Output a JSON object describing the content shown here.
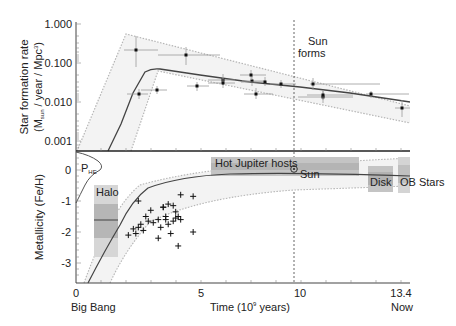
{
  "chart_data": [
    {
      "type": "scatter",
      "title": "",
      "xlabel": "Time (10^9 years)",
      "ylabel": "Star formation rate (M_sun / year / Mpc^3)",
      "yscale": "log",
      "ylim": [
        0.0005,
        1.0
      ],
      "xlim": [
        0,
        13.4
      ],
      "ytick_labels": [
        "1.000",
        "0.100",
        "0.010",
        "0.001"
      ],
      "points": [
        {
          "x": 2.2,
          "y": 0.19,
          "xerr": [
            1.4,
            3.0
          ],
          "yerr": [
            0.065,
            0.45
          ]
        },
        {
          "x": 2.5,
          "y": 0.015,
          "xerr": [
            1.9,
            3.1
          ],
          "yerr": [
            0.012,
            0.019
          ]
        },
        {
          "x": 3.0,
          "y": 0.017,
          "xerr": [
            2.6,
            3.7
          ],
          "yerr": [
            0.014,
            0.021
          ]
        },
        {
          "x": 4.4,
          "y": 0.15,
          "xerr": [
            3.0,
            7.2
          ],
          "yerr": [
            0.09,
            0.25
          ]
        },
        {
          "x": 5.2,
          "y": 0.023,
          "xerr": [
            4.5,
            5.9
          ],
          "yerr": [
            0.018,
            0.03
          ]
        },
        {
          "x": 6.2,
          "y": 0.033,
          "xerr": [
            5.2,
            7.0
          ],
          "yerr": [
            0.026,
            0.042
          ]
        },
        {
          "x": 6.2,
          "y": 0.028,
          "xerr": [
            5.2,
            7.0
          ],
          "yerr": [
            0.022,
            0.035
          ]
        },
        {
          "x": 7.2,
          "y": 0.032,
          "xerr": [
            6.3,
            8.0
          ],
          "yerr": [
            0.026,
            0.04
          ]
        },
        {
          "x": 7.7,
          "y": 0.042,
          "xerr": [
            7.0,
            8.5
          ],
          "yerr": [
            0.035,
            0.05
          ]
        },
        {
          "x": 8.2,
          "y": 0.015,
          "xerr": [
            7.1,
            9.3
          ],
          "yerr": [
            0.012,
            0.019
          ]
        },
        {
          "x": 8.5,
          "y": 0.031,
          "xerr": [
            7.6,
            9.4
          ],
          "yerr": [
            0.026,
            0.037
          ]
        },
        {
          "x": 9.2,
          "y": 0.028,
          "xerr": [
            8.7,
            9.7
          ],
          "yerr": [
            0.024,
            0.033
          ]
        },
        {
          "x": 10.5,
          "y": 0.028,
          "xerr": [
            9.9,
            13.1
          ],
          "yerr": [
            0.02,
            0.036
          ]
        },
        {
          "x": 11.1,
          "y": 0.013,
          "xerr": [
            9.9,
            11.9
          ],
          "yerr": [
            0.011,
            0.016
          ]
        },
        {
          "x": 11.2,
          "y": 0.014,
          "xerr": [
            10.3,
            12.1
          ],
          "yerr": [
            0.012,
            0.017
          ]
        },
        {
          "x": 12.8,
          "y": 0.015,
          "xerr": [
            12.7,
            13.4
          ],
          "yerr": [
            0.013,
            0.017
          ]
        },
        {
          "x": 13.2,
          "y": 0.0065,
          "xerr": [
            12.8,
            13.5
          ],
          "yerr": [
            0.004,
            0.011
          ]
        }
      ],
      "model_curve": {
        "x": [
          1.3,
          1.8,
          2.3,
          2.8,
          3.3,
          5,
          7,
          9,
          11,
          13.4
        ],
        "y": [
          0.0005,
          0.0025,
          0.015,
          0.055,
          0.072,
          0.055,
          0.04,
          0.03,
          0.022,
          0.015
        ]
      },
      "envelope_upper": {
        "x": [
          0.05,
          2.0,
          13.4
        ],
        "y": [
          0.0005,
          0.55,
          0.02
        ]
      },
      "envelope_lower": {
        "x": [
          2.2,
          3.3,
          13.4
        ],
        "y": [
          0.0005,
          0.014,
          0.0055
        ]
      },
      "annotations": [
        {
          "text": "Sun forms",
          "x": 9.6
        }
      ]
    },
    {
      "type": "scatter",
      "xlabel": "Time (10^9 years)",
      "ylabel": "Metallicity (Fe/H)",
      "ylim": [
        -3.6,
        0.6
      ],
      "xlim": [
        0,
        13.4
      ],
      "ytick_labels": [
        "0",
        "-1",
        "-2",
        "-3"
      ],
      "xtick_labels": [
        "0",
        "5",
        "10",
        "13.4"
      ],
      "xtick_sublabels": [
        "Big Bang",
        "",
        "",
        "Now"
      ],
      "halo_stars": [
        {
          "x": 2.5,
          "y": -1.0
        },
        {
          "x": 3.0,
          "y": -1.3
        },
        {
          "x": 3.5,
          "y": -1.2
        },
        {
          "x": 3.7,
          "y": -1.1
        },
        {
          "x": 3.9,
          "y": -1.15
        },
        {
          "x": 4.2,
          "y": -0.8
        },
        {
          "x": 4.7,
          "y": -0.85
        },
        {
          "x": 2.8,
          "y": -1.5
        },
        {
          "x": 2.9,
          "y": -1.65
        },
        {
          "x": 3.1,
          "y": -1.7
        },
        {
          "x": 3.3,
          "y": -1.6
        },
        {
          "x": 3.6,
          "y": -1.5
        },
        {
          "x": 3.6,
          "y": -1.6
        },
        {
          "x": 3.7,
          "y": -1.75
        },
        {
          "x": 3.9,
          "y": -1.65
        },
        {
          "x": 4.0,
          "y": -1.55
        },
        {
          "x": 4.1,
          "y": -1.5
        },
        {
          "x": 4.2,
          "y": -1.6
        },
        {
          "x": 2.3,
          "y": -1.9
        },
        {
          "x": 2.5,
          "y": -1.85
        },
        {
          "x": 2.6,
          "y": -1.75
        },
        {
          "x": 2.7,
          "y": -1.95
        },
        {
          "x": 2.1,
          "y": -2.1
        },
        {
          "x": 2.4,
          "y": -2.05
        },
        {
          "x": 3.3,
          "y": -2.2
        },
        {
          "x": 3.8,
          "y": -2.05
        },
        {
          "x": 4.1,
          "y": -2.45
        },
        {
          "x": 4.7,
          "y": -2.0
        },
        {
          "x": 3.5,
          "y": -1.2
        },
        {
          "x": 4.0,
          "y": -1.35
        },
        {
          "x": 3.4,
          "y": -1.85
        }
      ],
      "model_curve": {
        "x": [
          0.9,
          1.5,
          2.0,
          2.5,
          3.0,
          4,
          6,
          9.6,
          13.4
        ],
        "y": [
          -3.6,
          -2.7,
          -1.9,
          -1.3,
          -0.95,
          -0.6,
          -0.4,
          -0.25,
          -0.2
        ]
      },
      "regions": [
        {
          "label": "Halo",
          "x": [
            0.8,
            1.6
          ],
          "y": [
            -2.8,
            -0.5
          ],
          "inner_y": [
            -2.2,
            -1.1
          ],
          "median": -1.6
        },
        {
          "label": "Hot Jupiter hosts",
          "x": [
            5.3,
            12.1
          ],
          "y": [
            -0.35,
            0.3
          ]
        },
        {
          "label": "Disk",
          "x": [
            12.2,
            13.1
          ],
          "y": [
            -0.7,
            0.1
          ]
        },
        {
          "label": "OB Stars",
          "x": [
            13.1,
            13.5
          ],
          "y": [
            -0.7,
            0.3
          ]
        }
      ],
      "points_labeled": [
        {
          "label": "Sun",
          "x": 9.6,
          "y": 0.0
        }
      ],
      "distribution_label": "P_HE"
    }
  ],
  "labels": {
    "top_ylabel_line1": "Star formation rate",
    "top_ylabel_line2_pre": "(M",
    "top_ylabel_sub": "sun",
    "top_ylabel_line2_post": " / year / Mpc",
    "top_ylabel_sup": "3",
    "top_ylabel_close": ")",
    "top_yticks": [
      "1.000",
      "0.100",
      "0.010",
      "0.001"
    ],
    "sun_forms_line1": "Sun",
    "sun_forms_line2": "forms",
    "bottom_ylabel": "Metallicity (Fe/H)",
    "bottom_yticks": [
      "0",
      "-1",
      "-2",
      "-3"
    ],
    "xticks": [
      "0",
      "5",
      "10",
      "13.4"
    ],
    "x_big_bang": "Big Bang",
    "x_now": "Now",
    "xlabel_pre": "Time (10",
    "xlabel_sup": "9",
    "xlabel_post": " years)",
    "halo": "Halo",
    "hot_jupiter": "Hot Jupiter hosts",
    "sun": "Sun",
    "disk": "Disk",
    "ob_stars": "OB Stars",
    "phe_main": "P",
    "phe_sub": "HE"
  },
  "colors": {
    "axis": "#222222",
    "curve": "#444444",
    "envelope": "#b0b0b0",
    "envelope_fill": "#f2f2f2",
    "region_light": "#d8d8d8",
    "region_dark": "#b8b8b8",
    "point": "#111111",
    "errorbar": "#9a9a9a"
  }
}
